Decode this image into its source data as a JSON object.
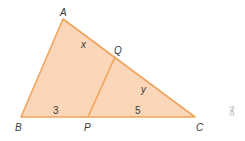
{
  "diagram": {
    "type": "triangle",
    "colors": {
      "fill": "#fbd6b8",
      "stroke": "#f0a45c",
      "text": "#3a3a3a",
      "credit": "#8a8a8a"
    },
    "vertices": {
      "A": "A",
      "B": "B",
      "C": "C",
      "P": "P",
      "Q": "Q"
    },
    "segment_labels": {
      "AQ": "x",
      "QC": "y",
      "BP": "3",
      "PC": "5"
    },
    "credit": "DAE"
  }
}
